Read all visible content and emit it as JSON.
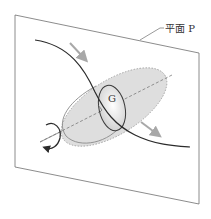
{
  "diagram": {
    "plane_label": "平面 P",
    "center_label": "G",
    "colors": {
      "plane_edge": "#6e6e6e",
      "curve": "#2b2b2b",
      "ellipsoid_fill": "#d9d9d9",
      "ellipsoid_edge": "#8a8a8a",
      "section_fill": "#f4f4f4",
      "motion_arrow": "#a8a8a8",
      "axis_dash": "#7a7a7a",
      "rotation_arrow": "#2b2b2b"
    },
    "elements": [
      "plane",
      "trajectory-curve",
      "ellipsoid-body",
      "cross-section",
      "center-of-mass",
      "principal-axis",
      "motion-arrows",
      "rotation-arrow"
    ]
  }
}
